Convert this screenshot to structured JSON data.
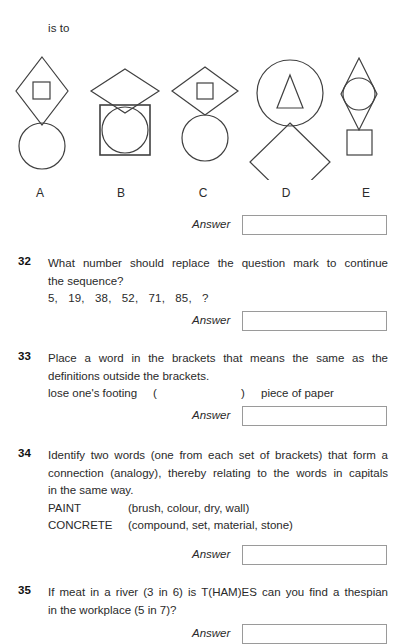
{
  "stem": {
    "is_to_text": "is to"
  },
  "figures": {
    "options": [
      {
        "letter": "A",
        "description": "tall-diamond-with-small-square-above-circle"
      },
      {
        "letter": "B",
        "description": "wide-diamond-above-square-containing-circle"
      },
      {
        "letter": "C",
        "description": "wide-diamond-with-small-square-above-circle"
      },
      {
        "letter": "D",
        "description": "circle-with-triangle-above-diamond"
      },
      {
        "letter": "E",
        "description": "tall-diamond-with-circle-above-small-square"
      }
    ]
  },
  "answer_label": "Answer",
  "answer_value": "",
  "questions": [
    {
      "number": "32",
      "lines": [
        "What number should replace the question mark to continue",
        "the sequence?"
      ],
      "sequence": "5,   19,   38,   52,   71,   85,   ?"
    },
    {
      "number": "33",
      "lines": [
        "Place a word in the brackets that means the same as the",
        "definitions outside the brackets."
      ],
      "bracket_clue_left": "lose one's footing",
      "bracket_open": "(",
      "bracket_close": ")",
      "bracket_clue_right": "piece of paper"
    },
    {
      "number": "34",
      "lines": [
        "Identify two words (one from each set of brackets) that form a",
        "connection (analogy), thereby relating to the words in capitals",
        "in the same way."
      ],
      "pairs": [
        {
          "capital": "PAINT",
          "options": "(brush, colour, dry, wall)"
        },
        {
          "capital": "CONCRETE",
          "options": "(compound, set, material, stone)"
        }
      ]
    },
    {
      "number": "35",
      "lines": [
        "If meat in a river (3 in 6) is T(HAM)ES can you find a thespian",
        "in the workplace (5 in 7)?"
      ]
    }
  ],
  "colors": {
    "ink": "#2a2a2a",
    "stroke": "#404040",
    "box_border": "#9a9a9a",
    "page": "#ffffff"
  }
}
